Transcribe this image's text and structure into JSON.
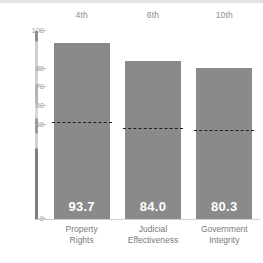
{
  "chart_data": {
    "type": "bar",
    "title": "",
    "xlabel": "",
    "ylabel": "",
    "ylim": [
      0,
      100
    ],
    "grid": false,
    "legend_position": "none",
    "categories": [
      "Property Rights",
      "Judicial Effectiveness",
      "Government Integrity"
    ],
    "values": [
      93.7,
      84.0,
      80.3
    ],
    "value_labels": [
      "93.7",
      "84.0",
      "80.3"
    ],
    "rank_labels": [
      "4th",
      "6th",
      "10th"
    ],
    "y_ticks": [
      100,
      80,
      70,
      60,
      50,
      0
    ],
    "y_tick_labels": [
      "100",
      "80",
      "70",
      "60",
      "50",
      "0"
    ],
    "reference_lines": {
      "name": "world average",
      "style": "dashed",
      "values": [
        51.0,
        48.0,
        47.0
      ]
    },
    "series": [
      {
        "name": "score",
        "values": [
          93.7,
          84.0,
          80.3
        ]
      }
    ]
  },
  "colors": {
    "bar_fill": "#8a8a8a",
    "value_text": "#ffffff",
    "tick_text": "#9a9a9a",
    "category_text": "#7a7a7a",
    "rank_text": "#8d8d8d",
    "reference_line": "#1f1f1f",
    "background": "#ffffff"
  },
  "categories_wrapped": [
    {
      "line1": "Property",
      "line2": "Rights"
    },
    {
      "line1": "Judicial",
      "line2": "Effectiveness"
    },
    {
      "line1": "Government",
      "line2": "Integrity"
    }
  ]
}
